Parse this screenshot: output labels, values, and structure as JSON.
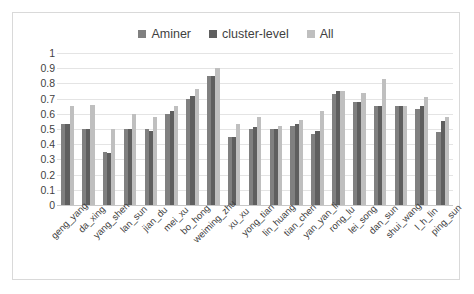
{
  "legend": {
    "items": [
      {
        "label": "Aminer",
        "color": "#808080"
      },
      {
        "label": "cluster-level",
        "color": "#5f5f5f"
      },
      {
        "label": "All",
        "color": "#bfbfbf"
      }
    ]
  },
  "axis": {
    "y_ticks": [
      "1",
      "0.9",
      "0.8",
      "0.7",
      "0.6",
      "0.5",
      "0.4",
      "0.3",
      "0.2",
      "0.1",
      "0"
    ]
  },
  "chart_data": {
    "type": "bar",
    "title": "",
    "xlabel": "",
    "ylabel": "",
    "ylim": [
      0,
      1
    ],
    "grid": true,
    "legend_position": "top-center",
    "categories": [
      "geng_yang",
      "da_xing",
      "yang_shen",
      "lan_sun",
      "jian_du",
      "mei_xu",
      "bo_hong",
      "weiming_zhu",
      "xu_xu",
      "yong_tian",
      "lin_huang",
      "tian_chen",
      "yan_yan_li",
      "rong_lu",
      "lei_song",
      "dan_sun",
      "shui_wang",
      "l_h_lin",
      "ping_sun"
    ],
    "series": [
      {
        "name": "Aminer",
        "color": "#808080",
        "values": [
          0.53,
          0.5,
          0.35,
          0.5,
          0.5,
          0.6,
          0.7,
          0.85,
          0.45,
          0.5,
          0.5,
          0.52,
          0.47,
          0.73,
          0.68,
          0.65,
          0.65,
          0.63,
          0.48
        ]
      },
      {
        "name": "cluster-level",
        "color": "#5f5f5f",
        "values": [
          0.53,
          0.5,
          0.34,
          0.5,
          0.49,
          0.62,
          0.72,
          0.85,
          0.45,
          0.51,
          0.5,
          0.53,
          0.49,
          0.75,
          0.68,
          0.65,
          0.65,
          0.65,
          0.55
        ]
      },
      {
        "name": "All",
        "color": "#bfbfbf",
        "values": [
          0.65,
          0.66,
          0.5,
          0.6,
          0.58,
          0.65,
          0.76,
          0.9,
          0.53,
          0.58,
          0.52,
          0.56,
          0.62,
          0.75,
          0.74,
          0.83,
          0.65,
          0.71,
          0.58
        ]
      }
    ]
  }
}
